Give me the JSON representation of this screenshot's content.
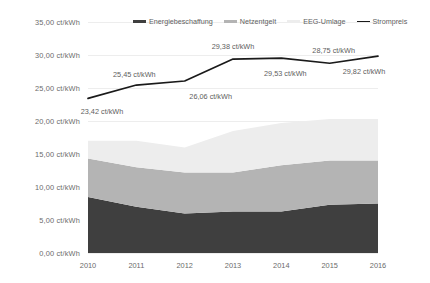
{
  "chart_data": {
    "type": "area",
    "title": "",
    "subtitle": "",
    "xlabel": "",
    "ylabel": "",
    "categories": [
      "2010",
      "2011",
      "2012",
      "2013",
      "2014",
      "2015",
      "2016"
    ],
    "x_tick_labels": [
      "2010",
      "2011",
      "2012",
      "2013",
      "2014",
      "2015",
      "2016"
    ],
    "y_tick_labels": [
      "35,00 ct/kWh",
      "30,00 ct/kWh",
      "25,00 ct/kWh",
      "20,00 ct/kWh",
      "15,00 ct/kWh",
      "10,00 ct/kWh",
      "5,00 ct/kWh",
      "0,00 ct/kWh"
    ],
    "y_tick_values": [
      35,
      30,
      25,
      20,
      15,
      10,
      5,
      0
    ],
    "ylim": [
      0,
      35
    ],
    "grid": true,
    "legend_position": "top-center",
    "unit": "ct/kWh",
    "stacked": true,
    "series": [
      {
        "name": "Energiebeschaffung",
        "kind": "area",
        "color": "#3f3f3f",
        "values": [
          8.5,
          7.0,
          6.0,
          6.3,
          6.3,
          7.3,
          7.5
        ]
      },
      {
        "name": "Netzentgelt",
        "kind": "area",
        "color": "#b4b4b4",
        "values": [
          5.8,
          6.0,
          6.2,
          5.9,
          7.0,
          6.7,
          6.5
        ]
      },
      {
        "name": "EEG-Umlage",
        "kind": "area",
        "color": "#ededed",
        "values": [
          2.7,
          4.0,
          3.8,
          6.3,
          6.4,
          6.3,
          6.3
        ]
      },
      {
        "name": "Strompreis",
        "kind": "line",
        "color": "#1a1a1a",
        "values": [
          23.42,
          25.45,
          26.06,
          29.38,
          29.53,
          28.75,
          29.82
        ],
        "point_labels": [
          "23,42 ct/kWh",
          "25,45 ct/kWh",
          "26,06 ct/kWh",
          "29,38 ct/kWh",
          "29,53 ct/kWh",
          "28,75 ct/kWh",
          "29,82 ct/kWh"
        ]
      }
    ],
    "legend": [
      {
        "label": "Energiebeschaffung",
        "color": "#3f3f3f",
        "marker": "bar"
      },
      {
        "label": "Netzentgelt",
        "color": "#b4b4b4",
        "marker": "bar"
      },
      {
        "label": "EEG-Umlage",
        "color": "#ededed",
        "marker": "bar"
      },
      {
        "label": "Strompreis",
        "color": "#1a1a1a",
        "marker": "line"
      }
    ]
  },
  "colors": {
    "energiebeschaffung": "#3f3f3f",
    "netzentgelt": "#b4b4b4",
    "eeg_umlage": "#ededed",
    "strompreis": "#1a1a1a",
    "gridline": "#ededed",
    "axis_text": "#6b6b6b",
    "background": "#ffffff"
  }
}
